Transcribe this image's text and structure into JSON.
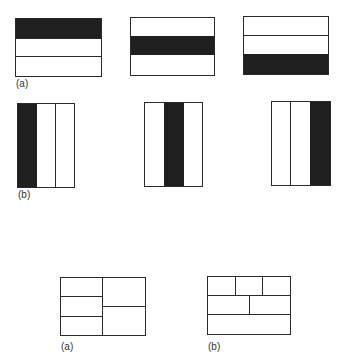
{
  "figure": {
    "row_a": {
      "label": "(a)",
      "description": "Three horizontal stripe panels, with the filled stripe at top, middle, bottom",
      "panels": [
        {
          "filled_index": 0,
          "stripes": 3
        },
        {
          "filled_index": 1,
          "stripes": 3
        },
        {
          "filled_index": 2,
          "stripes": 3
        }
      ],
      "fill_color": "#1f1f1f"
    },
    "row_b": {
      "label": "(b)",
      "description": "Three vertical stripe panels, with the filled stripe at left, middle, right",
      "panels": [
        {
          "filled_index": 0,
          "stripes": 3
        },
        {
          "filled_index": 1,
          "stripes": 3
        },
        {
          "filled_index": 2,
          "stripes": 3
        }
      ],
      "fill_color": "#1f1f1f"
    },
    "bottom_a": {
      "label": "(a)",
      "description": "Rectangle split into two columns: left column with 3 rows, right column with 2 rows"
    },
    "bottom_b": {
      "label": "(b)",
      "description": "Rectangle split into three rows: top row 3 cells, middle row 2 cells, bottom row 1 cell"
    }
  }
}
